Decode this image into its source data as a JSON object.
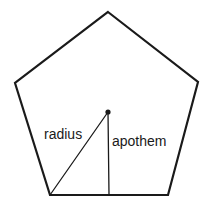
{
  "figure": {
    "kind": "geometry-diagram",
    "shape_name": "regular pentagon",
    "background_color": "#ffffff",
    "stroke_color": "#1a1a1a",
    "fill_color": "#ffffff",
    "text_color": "#1a1a1a"
  },
  "polygon": {
    "sides": 5,
    "stroke_width": 2.2,
    "points": "108,12 198,82 168,195 50,195 15,83",
    "vertices": [
      {
        "name": "top-vertex",
        "x": 108,
        "y": 12
      },
      {
        "name": "right-vertex",
        "x": 198,
        "y": 82
      },
      {
        "name": "bottom-right-vertex",
        "x": 168,
        "y": 195
      },
      {
        "name": "bottom-left-vertex",
        "x": 50,
        "y": 195
      },
      {
        "name": "left-vertex",
        "x": 15,
        "y": 83
      }
    ]
  },
  "center": {
    "x": 108,
    "y": 112,
    "dot_radius": 2.6
  },
  "segments": [
    {
      "name": "radius",
      "label": "radius",
      "x1": 108,
      "y1": 112,
      "x2": 50,
      "y2": 195,
      "stroke_width": 1.3,
      "label_x": 44,
      "label_y": 139
    },
    {
      "name": "apothem",
      "label": "apothem",
      "x1": 108,
      "y1": 112,
      "x2": 109,
      "y2": 195,
      "stroke_width": 1.3,
      "label_x": 112,
      "label_y": 146
    }
  ]
}
